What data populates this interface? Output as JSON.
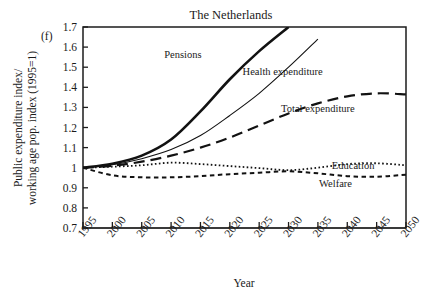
{
  "figure": {
    "panel_label": "(f)",
    "title": "The Netherlands",
    "xlabel": "Year",
    "ylabel_line1": "Public expenditure index/",
    "ylabel_line2": "working age pop. index (1995=1)"
  },
  "chart_data": {
    "type": "line",
    "title": "The Netherlands",
    "panel_label": "(f)",
    "xlabel": "Year",
    "ylabel": "Public expenditure index/ working age pop. index (1995=1)",
    "xlim": [
      1995,
      2050
    ],
    "ylim": [
      0.7,
      1.7
    ],
    "grid": false,
    "legend": "inline-annotations",
    "xticks": [
      1995,
      2000,
      2005,
      2010,
      2015,
      2020,
      2025,
      2030,
      2035,
      2040,
      2045,
      2050
    ],
    "xtick_labels": [
      "1995",
      "2000",
      "2005",
      "2010",
      "2015",
      "2020",
      "2025",
      "2030",
      "2035",
      "2040",
      "2045",
      "2050"
    ],
    "yticks": [
      0.7,
      0.8,
      0.9,
      1.0,
      1.1,
      1.2,
      1.3,
      1.4,
      1.5,
      1.6,
      1.7
    ],
    "ytick_labels": [
      "0.7",
      "0.8",
      "0.9",
      "1",
      "1.1",
      "1.2",
      "1.3",
      "1.4",
      "1.5",
      "1.6",
      "1.7"
    ],
    "x": [
      1995,
      2000,
      2005,
      2010,
      2015,
      2020,
      2025,
      2030,
      2035,
      2040,
      2045,
      2050
    ],
    "series": [
      {
        "name": "Pensions",
        "style": "thick-solid",
        "label_x": 2012,
        "label_y": 1.565,
        "clipped_top": true,
        "values": [
          1.0,
          1.02,
          1.06,
          1.14,
          1.28,
          1.44,
          1.58,
          1.7,
          null,
          null,
          null,
          null
        ]
      },
      {
        "name": "Health expenditure",
        "style": "thin-solid",
        "label_x": 2029,
        "label_y": 1.48,
        "clipped_top": true,
        "values": [
          1.0,
          1.015,
          1.045,
          1.09,
          1.16,
          1.26,
          1.37,
          1.5,
          1.64,
          null,
          null,
          null
        ]
      },
      {
        "name": "Total expenditure",
        "style": "long-dash",
        "label_x": 2035,
        "label_y": 1.295,
        "clipped_top": false,
        "values": [
          1.0,
          1.01,
          1.03,
          1.06,
          1.1,
          1.15,
          1.21,
          1.27,
          1.32,
          1.355,
          1.37,
          1.365
        ]
      },
      {
        "name": "Education",
        "style": "fine-dot",
        "label_x": 2041,
        "label_y": 1.012,
        "clipped_top": false,
        "values": [
          1.0,
          1.005,
          1.012,
          1.025,
          1.018,
          1.008,
          0.998,
          0.988,
          1.0,
          1.018,
          1.022,
          1.012
        ]
      },
      {
        "name": "Welfare",
        "style": "med-dash",
        "label_x": 2038,
        "label_y": 0.925,
        "clipped_top": false,
        "values": [
          1.0,
          0.962,
          0.952,
          0.952,
          0.958,
          0.968,
          0.975,
          0.982,
          0.972,
          0.958,
          0.955,
          0.965
        ]
      }
    ]
  }
}
